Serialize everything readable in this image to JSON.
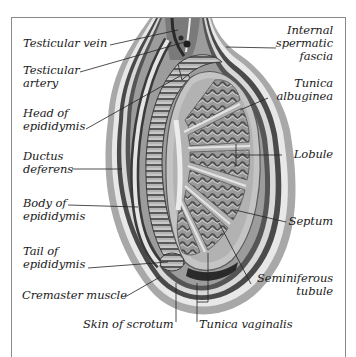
{
  "diagram": {
    "colors": {
      "ink": "#1a1a1a",
      "frame": "#8a8a8a",
      "tissue_dark": "#3c3c3c",
      "tissue_mid": "#8c8c8c",
      "tissue_light": "#c8c8c8",
      "skin": "#a8a8a8",
      "background": "#ffffff"
    },
    "labels_left": [
      {
        "id": "testicular-vein",
        "line1": "Testicular vein",
        "line2": ""
      },
      {
        "id": "testicular-artery",
        "line1": "Testicular",
        "line2": "artery"
      },
      {
        "id": "head-of-epididymis",
        "line1": "Head of",
        "line2": "epididymis"
      },
      {
        "id": "ductus-deferens",
        "line1": "Ductus",
        "line2": "deferens"
      },
      {
        "id": "body-of-epididymis",
        "line1": "Body of",
        "line2": "epididymis"
      },
      {
        "id": "tail-of-epididymis",
        "line1": "Tail of",
        "line2": "epididymis"
      },
      {
        "id": "cremaster-muscle",
        "line1": "Cremaster muscle",
        "line2": ""
      }
    ],
    "labels_right": [
      {
        "id": "internal-spermatic-fascia",
        "line1": "Internal",
        "line2": "spermatic",
        "line3": "fascia"
      },
      {
        "id": "tunica-albuginea",
        "line1": "Tunica",
        "line2": "albuginea"
      },
      {
        "id": "lobule",
        "line1": "Lobule"
      },
      {
        "id": "septum",
        "line1": "Septum"
      },
      {
        "id": "seminiferous-tubule",
        "line1": "Seminiferous",
        "line2": "tubule"
      }
    ],
    "labels_bottom": [
      {
        "id": "skin-of-scrotum",
        "line1": "Skin of scrotum"
      },
      {
        "id": "tunica-vaginalis",
        "line1": "Tunica vaginalis"
      }
    ]
  }
}
